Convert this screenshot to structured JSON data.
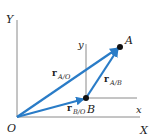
{
  "diagram": {
    "colors": {
      "vector": "#2a7cc7",
      "axis": "#8a8a8a",
      "point": "#111111",
      "text": "#222222"
    },
    "axes": {
      "fixed": {
        "x_label": "X",
        "y_label": "Y",
        "origin_label": "O"
      },
      "translating": {
        "x_label": "x",
        "y_label": "y"
      }
    },
    "points": [
      {
        "name": "A",
        "label": "A"
      },
      {
        "name": "B",
        "label": "B"
      }
    ],
    "vectors": [
      {
        "name": "r_A/O",
        "symbol": "r",
        "subscript": "A/O"
      },
      {
        "name": "r_B/O",
        "symbol": "r",
        "subscript": "B/O"
      },
      {
        "name": "r_A/B",
        "symbol": "r",
        "subscript": "A/B"
      }
    ]
  }
}
